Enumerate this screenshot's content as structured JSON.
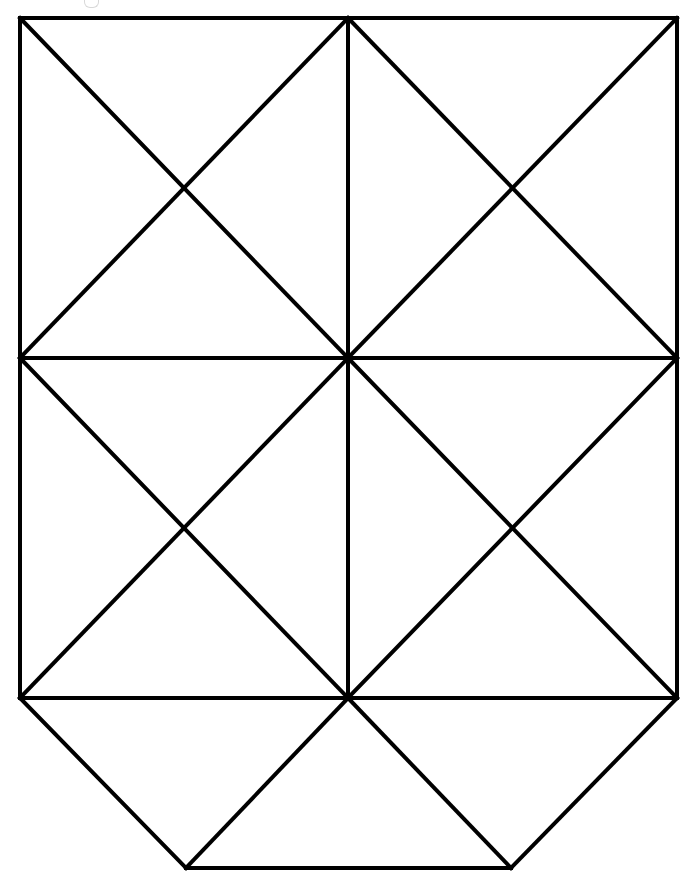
{
  "figure": {
    "canvas": {
      "width": 700,
      "height": 888
    },
    "background_color": "#ffffff",
    "stroke_color": "#000000",
    "stroke_width": 4,
    "vertices": {
      "top_left": {
        "x": 20,
        "y": 18
      },
      "top_mid": {
        "x": 348,
        "y": 18
      },
      "top_right": {
        "x": 677,
        "y": 18
      },
      "left_mid": {
        "x": 20,
        "y": 358
      },
      "center": {
        "x": 348,
        "y": 358
      },
      "right_mid": {
        "x": 677,
        "y": 358
      },
      "left_lower": {
        "x": 20,
        "y": 698
      },
      "center_lower": {
        "x": 348,
        "y": 698
      },
      "right_lower": {
        "x": 677,
        "y": 698
      },
      "bottom_left": {
        "x": 186,
        "y": 868
      },
      "bottom_right": {
        "x": 511,
        "y": 868
      },
      "x_tl": {
        "x": 186,
        "y": 190
      },
      "x_tr": {
        "x": 511,
        "y": 190
      },
      "x_bl": {
        "x": 186,
        "y": 528
      },
      "x_br": {
        "x": 511,
        "y": 528
      }
    },
    "segments": [
      {
        "name": "border-top",
        "x1": 20,
        "y1": 18,
        "x2": 677,
        "y2": 18
      },
      {
        "name": "border-left-upper",
        "x1": 20,
        "y1": 18,
        "x2": 20,
        "y2": 358
      },
      {
        "name": "border-left-lower",
        "x1": 20,
        "y1": 358,
        "x2": 20,
        "y2": 698
      },
      {
        "name": "border-right-upper",
        "x1": 677,
        "y1": 18,
        "x2": 677,
        "y2": 358
      },
      {
        "name": "border-right-lower",
        "x1": 677,
        "y1": 358,
        "x2": 677,
        "y2": 698
      },
      {
        "name": "midline-horizontal-upper",
        "x1": 20,
        "y1": 358,
        "x2": 677,
        "y2": 358
      },
      {
        "name": "midline-horizontal-lower",
        "x1": 20,
        "y1": 698,
        "x2": 677,
        "y2": 698
      },
      {
        "name": "midline-vertical-upper",
        "x1": 348,
        "y1": 18,
        "x2": 348,
        "y2": 358
      },
      {
        "name": "midline-vertical-lower",
        "x1": 348,
        "y1": 358,
        "x2": 348,
        "y2": 698
      },
      {
        "name": "diag-q1-down",
        "x1": 20,
        "y1": 18,
        "x2": 348,
        "y2": 358
      },
      {
        "name": "diag-q1-up",
        "x1": 20,
        "y1": 358,
        "x2": 348,
        "y2": 18
      },
      {
        "name": "diag-q2-down",
        "x1": 348,
        "y1": 18,
        "x2": 677,
        "y2": 358
      },
      {
        "name": "diag-q2-up",
        "x1": 348,
        "y1": 358,
        "x2": 677,
        "y2": 18
      },
      {
        "name": "diag-q3-down",
        "x1": 20,
        "y1": 358,
        "x2": 348,
        "y2": 698
      },
      {
        "name": "diag-q3-up",
        "x1": 20,
        "y1": 698,
        "x2": 348,
        "y2": 358
      },
      {
        "name": "diag-q4-down",
        "x1": 348,
        "y1": 358,
        "x2": 677,
        "y2": 698
      },
      {
        "name": "diag-q4-up",
        "x1": 348,
        "y1": 698,
        "x2": 677,
        "y2": 358
      },
      {
        "name": "chamfer-left",
        "x1": 20,
        "y1": 698,
        "x2": 186,
        "y2": 868
      },
      {
        "name": "chamfer-right",
        "x1": 677,
        "y1": 698,
        "x2": 511,
        "y2": 868
      },
      {
        "name": "base-diag-left",
        "x1": 348,
        "y1": 698,
        "x2": 186,
        "y2": 868
      },
      {
        "name": "base-diag-right",
        "x1": 348,
        "y1": 698,
        "x2": 511,
        "y2": 868
      },
      {
        "name": "border-bottom",
        "x1": 186,
        "y1": 868,
        "x2": 511,
        "y2": 868
      }
    ]
  }
}
